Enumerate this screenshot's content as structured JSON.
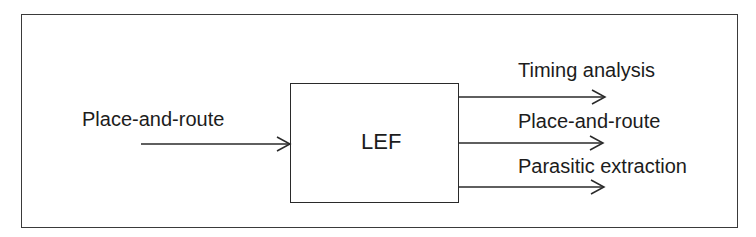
{
  "diagram": {
    "type": "block-flow",
    "center_block": {
      "label": "LEF"
    },
    "inputs": [
      {
        "label": "Place-and-route"
      }
    ],
    "outputs": [
      {
        "label": "Timing analysis"
      },
      {
        "label": "Place-and-route"
      },
      {
        "label": "Parasitic extraction"
      }
    ],
    "colors": {
      "line": "#2a2a2a",
      "background": "#ffffff"
    }
  }
}
